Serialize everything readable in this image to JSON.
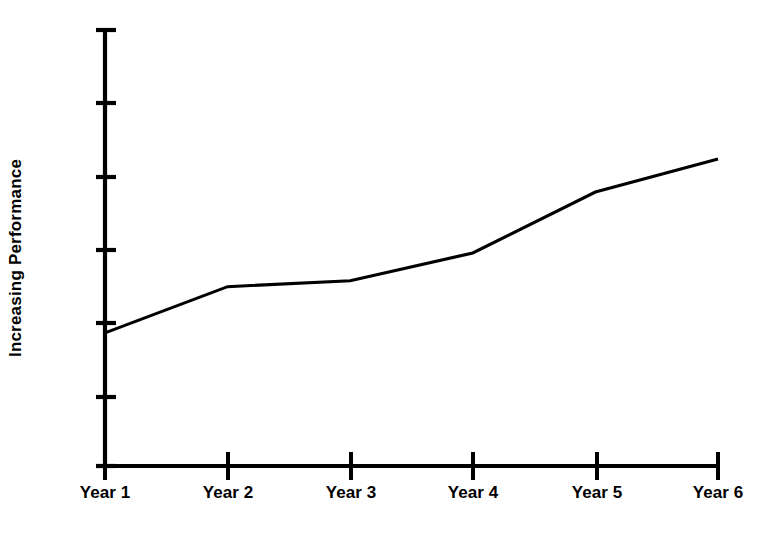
{
  "chart_data": {
    "type": "line",
    "title": "",
    "subtitle": "",
    "xlabel": "",
    "ylabel": "Increasing Performance",
    "categories": [
      "Year 1",
      "Year 2",
      "Year 3",
      "Year 4",
      "Year 5",
      "Year 6"
    ],
    "series": [
      {
        "name": "Performance",
        "values": [
          1.87,
          2.5,
          2.58,
          2.96,
          3.79,
          4.24
        ],
        "color": "#000000"
      }
    ],
    "x": [
      1,
      2,
      3,
      4,
      5,
      6
    ],
    "xlim": [
      1,
      6
    ],
    "ylim": [
      0,
      6
    ],
    "y_tick_count": 7,
    "y_tick_labels": [
      "",
      "",
      "",
      "",
      "",
      "",
      ""
    ],
    "x_tick_labels": [
      "Year 1",
      "Year 2",
      "Year 3",
      "Year 4",
      "Year 5",
      "Year 6"
    ],
    "grid": false,
    "legend": false,
    "legend_position": "none",
    "background_color": "#ffffff",
    "axis_color": "#000000",
    "annotations": []
  },
  "axes": {
    "y_label_text": "Increasing Performance",
    "x_labels": [
      {
        "text": "Year 1",
        "left_px": 105
      },
      {
        "text": "Year 2",
        "left_px": 228
      },
      {
        "text": "Year 3",
        "left_px": 351
      },
      {
        "text": "Year 4",
        "left_px": 473
      },
      {
        "text": "Year 5",
        "left_px": 597
      },
      {
        "text": "Year 6",
        "left_px": 718
      }
    ]
  }
}
